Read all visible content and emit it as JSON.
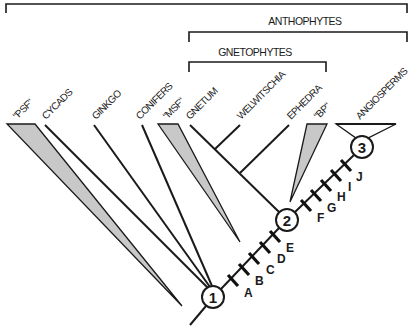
{
  "diagram": {
    "type": "cladogram",
    "colors": {
      "ink": "#1a1a1a",
      "triangle_fill": "#c8c8c8",
      "background": "#ffffff"
    },
    "brackets": [
      {
        "id": "all",
        "label": ""
      },
      {
        "id": "anthophytes",
        "label": "ANTHOPHYTES"
      },
      {
        "id": "gnetophytes",
        "label": "GNETOPHYTES"
      }
    ],
    "taxa": [
      {
        "id": "psf",
        "label": "\"PSF\"",
        "style": "shaded-triangle"
      },
      {
        "id": "cycads",
        "label": "CYCADS",
        "style": "line"
      },
      {
        "id": "ginkgo",
        "label": "GINKGO",
        "style": "line"
      },
      {
        "id": "conifers",
        "label": "CONIFERS",
        "style": "line"
      },
      {
        "id": "msf",
        "label": "\"MSF\"",
        "style": "shaded-triangle"
      },
      {
        "id": "gnetum",
        "label": "GNETUM",
        "style": "line"
      },
      {
        "id": "welwitschia",
        "label": "WELWITSCHIA",
        "style": "line"
      },
      {
        "id": "ephedra",
        "label": "EPHEDRA",
        "style": "line"
      },
      {
        "id": "bp",
        "label": "\"BP\"",
        "style": "shaded-triangle"
      },
      {
        "id": "angiosperms",
        "label": "ANGIOSPERMS",
        "style": "open-triangle"
      }
    ],
    "nodes": [
      {
        "id": "n1",
        "label": "1"
      },
      {
        "id": "n2",
        "label": "2"
      },
      {
        "id": "n3",
        "label": "3"
      }
    ],
    "characters": {
      "between_1_and_2": [
        "A",
        "B",
        "C",
        "D",
        "E"
      ],
      "between_2_and_3": [
        "F",
        "G",
        "H",
        "I",
        "J"
      ]
    }
  }
}
